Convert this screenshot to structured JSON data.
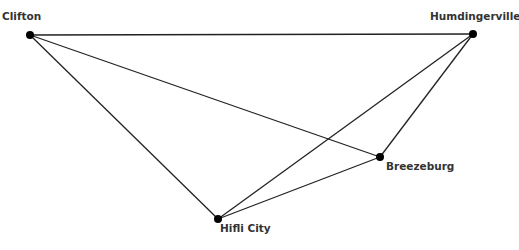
{
  "nodes": [
    {
      "id": "clifton",
      "label": "Clifton",
      "x": 30,
      "y": 35,
      "lx": 2,
      "ly": 10
    },
    {
      "id": "humdingerville",
      "label": "Humdingerville",
      "x": 473,
      "y": 34,
      "lx": 430,
      "ly": 10
    },
    {
      "id": "breezeburg",
      "label": "Breezeburg",
      "x": 380,
      "y": 157,
      "lx": 386,
      "ly": 160
    },
    {
      "id": "hifli",
      "label": "Hifli City",
      "x": 218,
      "y": 219,
      "lx": 220,
      "ly": 222
    }
  ],
  "edges": [
    [
      "clifton",
      "humdingerville"
    ],
    [
      "clifton",
      "breezeburg"
    ],
    [
      "clifton",
      "hifli"
    ],
    [
      "humdingerville",
      "breezeburg"
    ],
    [
      "humdingerville",
      "hifli"
    ],
    [
      "breezeburg",
      "hifli"
    ]
  ],
  "style": {
    "line_color": "#222222",
    "node_color": "#000000"
  }
}
